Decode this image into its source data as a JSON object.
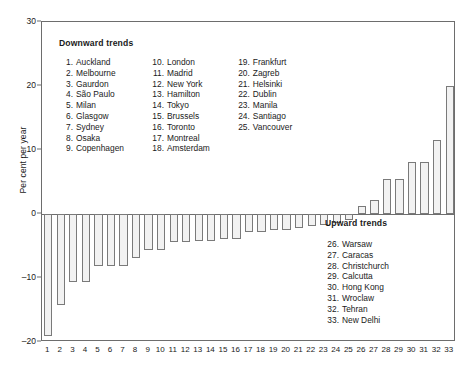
{
  "chart_data": {
    "type": "bar",
    "title": "",
    "xlabel": "",
    "ylabel": "Per cent per year",
    "ylim": [
      -20,
      30
    ],
    "yticks": [
      30,
      20,
      10,
      0,
      -10,
      -20
    ],
    "grid": false,
    "legend_position": "inside",
    "categories": [
      "1",
      "2",
      "3",
      "4",
      "5",
      "6",
      "7",
      "8",
      "9",
      "10",
      "11",
      "12",
      "13",
      "14",
      "15",
      "16",
      "17",
      "18",
      "19",
      "20",
      "21",
      "22",
      "23",
      "24",
      "25",
      "26",
      "27",
      "28",
      "29",
      "30",
      "31",
      "32",
      "33"
    ],
    "values": [
      -19,
      -14.2,
      -10.6,
      -10.6,
      -8.2,
      -8.2,
      -8.2,
      -6.9,
      -5.6,
      -5.6,
      -4.4,
      -4.4,
      -4.2,
      -4.2,
      -3.9,
      -3.9,
      -2.8,
      -2.8,
      -2.5,
      -2.5,
      -2.2,
      -1.9,
      -1.7,
      -1.4,
      -0.9,
      1.2,
      2.2,
      5.5,
      5.5,
      8.2,
      8.2,
      11.5,
      20
    ],
    "series": [
      {
        "name": "Trend",
        "values": [
          -19,
          -14.2,
          -10.6,
          -10.6,
          -8.2,
          -8.2,
          -8.2,
          -6.9,
          -5.6,
          -5.6,
          -4.4,
          -4.4,
          -4.2,
          -4.2,
          -3.9,
          -3.9,
          -2.8,
          -2.8,
          -2.5,
          -2.5,
          -2.2,
          -1.9,
          -1.7,
          -1.4,
          -0.9,
          1.2,
          2.2,
          5.5,
          5.5,
          8.2,
          8.2,
          11.5,
          20
        ]
      }
    ],
    "annotations": [
      {
        "text": "Downward trends",
        "role": "legend-heading"
      },
      {
        "text": "Upward trends",
        "role": "legend-heading"
      }
    ]
  },
  "legend_downward": {
    "title": "Downward trends",
    "column1": [
      {
        "num": "1.",
        "label": "Auckland"
      },
      {
        "num": "2.",
        "label": "Melbourne"
      },
      {
        "num": "3.",
        "label": "Gaurdon"
      },
      {
        "num": "4.",
        "label": "São Paulo"
      },
      {
        "num": "5.",
        "label": "Milan"
      },
      {
        "num": "6.",
        "label": "Glasgow"
      },
      {
        "num": "7.",
        "label": "Sydney"
      },
      {
        "num": "8.",
        "label": "Osaka"
      },
      {
        "num": "9.",
        "label": "Copenhagen"
      }
    ],
    "column2": [
      {
        "num": "10.",
        "label": "London"
      },
      {
        "num": "11.",
        "label": "Madrid"
      },
      {
        "num": "12.",
        "label": "New York"
      },
      {
        "num": "13.",
        "label": "Hamilton"
      },
      {
        "num": "14.",
        "label": "Tokyo"
      },
      {
        "num": "15.",
        "label": "Brussels"
      },
      {
        "num": "16.",
        "label": "Toronto"
      },
      {
        "num": "17.",
        "label": "Montreal"
      },
      {
        "num": "18.",
        "label": "Amsterdam"
      }
    ],
    "column3": [
      {
        "num": "19.",
        "label": "Frankfurt"
      },
      {
        "num": "20.",
        "label": "Zagreb"
      },
      {
        "num": "21.",
        "label": "Helsinki"
      },
      {
        "num": "22.",
        "label": "Dublin"
      },
      {
        "num": "23.",
        "label": "Manila"
      },
      {
        "num": "24.",
        "label": "Santiago"
      },
      {
        "num": "25.",
        "label": "Vancouver"
      }
    ]
  },
  "legend_upward": {
    "title": "Upward trends",
    "column1": [
      {
        "num": "26.",
        "label": "Warsaw"
      },
      {
        "num": "27.",
        "label": "Caracas"
      },
      {
        "num": "28.",
        "label": "Christchurch"
      },
      {
        "num": "29.",
        "label": "Calcutta"
      },
      {
        "num": "30.",
        "label": "Hong Kong"
      },
      {
        "num": "31.",
        "label": "Wroclaw"
      },
      {
        "num": "32.",
        "label": "Tehran"
      },
      {
        "num": "33.",
        "label": "New Delhi"
      }
    ]
  },
  "colors": {
    "bar_fill": "#f2f2f2",
    "bar_stroke": "#7a7a7a",
    "axis": "#6d6d6d",
    "text": "#1a1a1a"
  }
}
